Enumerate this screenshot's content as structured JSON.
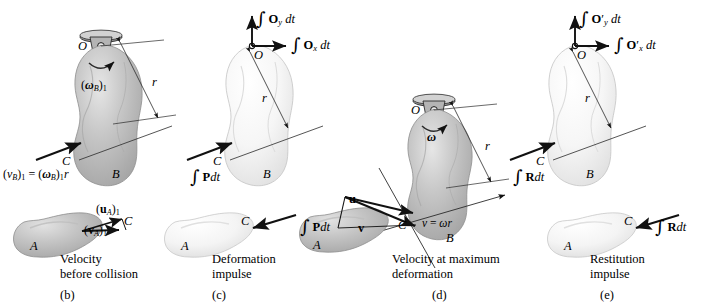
{
  "figure": {
    "type": "impulse-momentum diagram series",
    "background_color": "#ffffff",
    "body_fill_dark": "#b9b9b9",
    "body_fill_light": "#f2f2f2",
    "stroke_color": "#111111"
  },
  "panels": [
    {
      "id": "(b)",
      "caption_line1": "Velocity",
      "caption_line2": "before collision",
      "body_b_label": "B",
      "body_a_label": "A",
      "point_o": "O",
      "point_c": "C",
      "radius_label": "r",
      "angular_velocity": "(ωB)1",
      "velocity_equation": "(vB)1 = (ωB)1 r",
      "vector_u": "(uA)1",
      "vector_v": "(vA)1"
    },
    {
      "id": "(c)",
      "caption_line1": "Deformation",
      "caption_line2": "impulse",
      "body_b_label": "B",
      "body_a_label": "A",
      "point_o": "O",
      "point_c": "C",
      "radius_label": "r",
      "impulse_oy": "∫ Oy dt",
      "impulse_ox": "∫ Ox dt",
      "impulse_p_b": "∫ P dt",
      "impulse_p_a": "∫ P dt"
    },
    {
      "id": "(d)",
      "caption_line1": "Velocity at maximum",
      "caption_line2": "deformation",
      "body_b_label": "B",
      "body_a_label": "A",
      "point_o": "O",
      "point_c": "C",
      "radius_label": "r",
      "angular_velocity": "ω",
      "velocity_equation": "v = ωr",
      "vector_u": "u",
      "vector_v": "v"
    },
    {
      "id": "(e)",
      "caption_line1": "Restitution",
      "caption_line2": "impulse",
      "body_b_label": "B",
      "body_a_label": "A",
      "point_o": "O",
      "point_c": "C",
      "radius_label": "r",
      "impulse_oy": "∫ O′y dt",
      "impulse_ox": "∫ O′x dt",
      "impulse_r_b": "∫ R dt",
      "impulse_r_a": "∫ R dt"
    }
  ]
}
